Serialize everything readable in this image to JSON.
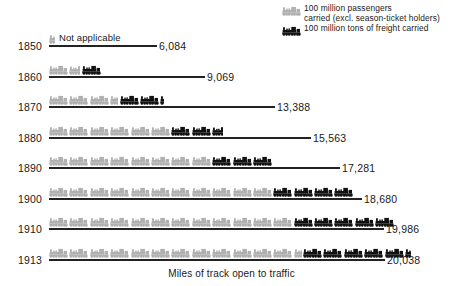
{
  "legend": {
    "items": [
      {
        "swatch": "train-icon-gray",
        "color": "#b0b0b0",
        "label": "100   million  passengers\ncarried (excl. season-ticket holders)"
      },
      {
        "swatch": "train-icon-black",
        "color": "#111111",
        "label": "100 million  tons of freight carried"
      }
    ]
  },
  "axis_caption": "Miles of track open to traffic",
  "not_applicable_label": "Not applicable",
  "chart_data": {
    "type": "bar",
    "title": "",
    "subtitle": "",
    "xlabel": "Miles of track open to traffic",
    "ylabel": "",
    "grid": false,
    "legend_position": "top-right",
    "unit_note": "Each locomotive glyph = 100 million passengers (gray) or 100 million tons of freight (black)",
    "categories": [
      "1850",
      "1860",
      "1870",
      "1880",
      "1890",
      "1900",
      "1910",
      "1913"
    ],
    "series": [
      {
        "name": "Miles of track open to traffic",
        "values": [
          6084,
          9069,
          13388,
          15563,
          17281,
          18680,
          19986,
          20038
        ],
        "value_labels": [
          "6,084",
          "9,069",
          "13,388",
          "15,563",
          "17,281",
          "18,680",
          "19,986",
          "20,038"
        ]
      },
      {
        "name": "100 million passengers carried (excl. season-ticket holders)",
        "glyph": "train-icon-gray",
        "glyph_counts": [
          0.3,
          1.6,
          3.4,
          6.0,
          8.0,
          11.0,
          12.0,
          12.4
        ]
      },
      {
        "name": "100 million tons of freight carried",
        "glyph": "train-icon-black",
        "glyph_counts": [
          0,
          1.0,
          2.2,
          2.6,
          3.0,
          4.0,
          5.0,
          5.3
        ]
      }
    ],
    "rows": [
      {
        "year": "1850",
        "miles": "6,084",
        "track_px": 108,
        "gray": 0.3,
        "black": 0,
        "not_applicable": true
      },
      {
        "year": "1860",
        "miles": "9,069",
        "track_px": 156,
        "gray": 1.6,
        "black": 1.0,
        "not_applicable": false
      },
      {
        "year": "1870",
        "miles": "13,388",
        "track_px": 226,
        "gray": 3.4,
        "black": 2.2,
        "not_applicable": false
      },
      {
        "year": "1880",
        "miles": "15,563",
        "track_px": 262,
        "gray": 6.0,
        "black": 2.6,
        "not_applicable": false
      },
      {
        "year": "1890",
        "miles": "17,281",
        "track_px": 291,
        "gray": 8.0,
        "black": 3.0,
        "not_applicable": false
      },
      {
        "year": "1900",
        "miles": "18,680",
        "track_px": 313,
        "gray": 11.0,
        "black": 4.0,
        "not_applicable": false
      },
      {
        "year": "1910",
        "miles": "19,986",
        "track_px": 335,
        "gray": 12.0,
        "black": 5.0,
        "not_applicable": false
      },
      {
        "year": "1913",
        "miles": "20,038",
        "track_px": 336,
        "gray": 12.4,
        "black": 5.3,
        "not_applicable": false
      }
    ]
  }
}
